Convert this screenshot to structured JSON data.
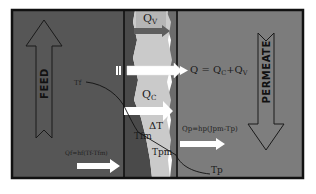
{
  "diagram": {
    "type": "membrane-distillation-heat-transfer-schematic",
    "regions": {
      "feed": {
        "label": "FEED",
        "color": "#565656"
      },
      "membrane": {
        "color": "#c9c9c9",
        "edge_color": "#6e6e6e"
      },
      "permeate": {
        "label": "PERMEATE",
        "color": "#7c7c7c"
      }
    },
    "labels": {
      "qv": "Q",
      "qv_sub": "V",
      "qc": "Q",
      "qc_sub": "C",
      "q_total": "Q = Q",
      "q_total_sub1": "C",
      "q_total_mid": "+Q",
      "q_total_sub2": "V",
      "tf": "Tf",
      "tfm": "Tfm",
      "delta_t": "ΔT",
      "tpm": "Tpm",
      "tp": "Tp",
      "qf_eq": "Qf=hf(Tf-Tfm)",
      "qp_eq": "Qp=hp(Jpm-Tp)"
    },
    "arrows": [
      {
        "name": "feed-flow-arrow",
        "direction": "up"
      },
      {
        "name": "permeate-flow-arrow",
        "direction": "down"
      },
      {
        "name": "vapor-heat-arrow",
        "direction": "right",
        "label": "Qv"
      },
      {
        "name": "total-heat-arrow",
        "direction": "right",
        "label": "Q"
      },
      {
        "name": "conductive-heat-arrow",
        "direction": "right",
        "label": "Qc"
      },
      {
        "name": "feed-heat-arrow",
        "direction": "right",
        "label": "Qf"
      },
      {
        "name": "permeate-heat-arrow",
        "direction": "right",
        "label": "Qp"
      }
    ]
  }
}
